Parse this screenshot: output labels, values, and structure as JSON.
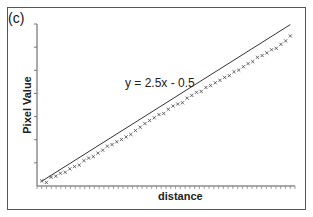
{
  "chart_data": {
    "type": "scatter",
    "panel_label": "(c)",
    "title": "",
    "xlabel": "distance",
    "ylabel": "Pixel Value",
    "annotation": "y = 2.5x - 0.5",
    "fit_line": {
      "slope": 2.5,
      "intercept": -0.5
    },
    "x": [
      1,
      2,
      3,
      4,
      5,
      6,
      7,
      8,
      9,
      10,
      11,
      12,
      13,
      14,
      15,
      16,
      17,
      18,
      19,
      20,
      21,
      22,
      23,
      24,
      25,
      26,
      27,
      28,
      29,
      30,
      31,
      32,
      33,
      34,
      35,
      36,
      37,
      38,
      39,
      40,
      41,
      42,
      43,
      44,
      45,
      46,
      47,
      48,
      49,
      50,
      51,
      52,
      53,
      54
    ],
    "y": [
      2.3,
      1.0,
      5.4,
      6.3,
      8.8,
      9.6,
      12.5,
      14.4,
      15.7,
      19.4,
      21.6,
      22.9,
      25.8,
      28.3,
      31.7,
      33.0,
      35.4,
      37.3,
      39.5,
      41.6,
      44.9,
      47.7,
      50.8,
      53.4,
      55.7,
      58.4,
      59.3,
      62.9,
      65.6,
      67.3,
      68.4,
      72.3,
      74.6,
      77.2,
      78.0,
      81.3,
      82.9,
      85.3,
      87.4,
      89.8,
      91.3,
      94.6,
      96.0,
      98.9,
      101.5,
      103.2,
      106.8,
      108.3,
      110.6,
      113.2,
      114.4,
      117.8,
      120.7,
      124.9
    ],
    "grid": false,
    "legend": "none",
    "y_ticks_count": 7,
    "x_ticks_count": 54
  },
  "labels": {
    "panel": "(c)",
    "xlabel": "distance",
    "ylabel": "Pixel Value",
    "equation": "y = 2.5x - 0.5"
  }
}
